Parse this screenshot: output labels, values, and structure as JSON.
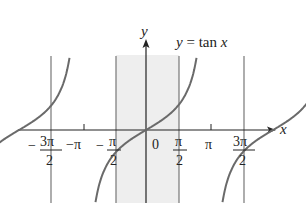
{
  "chart_data": {
    "type": "line",
    "title": "y = tan x",
    "function": "tan",
    "xlabel": "x",
    "ylabel": "y",
    "x_ticks": [
      {
        "label_num": "3π",
        "label_den": "2",
        "sign": "−",
        "value": -4.712
      },
      {
        "label": "−π",
        "value": -3.1416
      },
      {
        "label_num": "π",
        "label_den": "2",
        "sign": "−",
        "value": -1.5708
      },
      {
        "label": "0",
        "value": 0
      },
      {
        "label_num": "π",
        "label_den": "2",
        "sign": "",
        "value": 1.5708
      },
      {
        "label": "π",
        "value": 3.1416
      },
      {
        "label_num": "3π",
        "label_den": "2",
        "sign": "",
        "value": 4.712
      }
    ],
    "asymptotes": [
      -4.712,
      -1.5708,
      1.5708,
      4.712
    ],
    "highlighted_interval": [
      -1.5708,
      1.5708
    ],
    "xlim": [
      -5.2,
      5.8
    ],
    "ylim": [
      -3.0,
      3.0
    ],
    "grid": false,
    "colors": {
      "curve": "#6a6a6a",
      "axis": "#222222",
      "asymptote": "#777777",
      "shade": "#eeeeee"
    }
  },
  "labels": {
    "equation": "y = tan x",
    "x_axis": "x",
    "y_axis": "y",
    "zero": "0",
    "neg_pi": "−π",
    "pi": "π",
    "minus": "−",
    "pi_half_num": "π",
    "three_pi_num": "3π",
    "den_2": "2"
  }
}
